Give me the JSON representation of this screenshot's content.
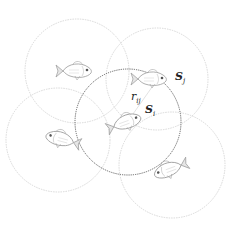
{
  "diagram": {
    "colors": {
      "faint_circle": "#d4d4d4",
      "focal_circle": "#555555",
      "fish_stroke": "#9a9a9a",
      "label": "#222222"
    },
    "circles": [
      {
        "id": "top-left",
        "cx": 77,
        "cy": 71,
        "r": 52,
        "style": "faint"
      },
      {
        "id": "top-right",
        "cx": 157,
        "cy": 79,
        "r": 51,
        "style": "faint"
      },
      {
        "id": "left",
        "cx": 58,
        "cy": 140,
        "r": 52,
        "style": "faint"
      },
      {
        "id": "bottom-right",
        "cx": 172,
        "cy": 165,
        "r": 53,
        "style": "faint"
      },
      {
        "id": "focal",
        "cx": 128,
        "cy": 122,
        "r": 53,
        "style": "focal"
      }
    ],
    "fish": [
      {
        "id": "fish-top-left",
        "x": 74,
        "y": 70,
        "facing": "right"
      },
      {
        "id": "fish-sj",
        "x": 152,
        "y": 79,
        "facing": "right"
      },
      {
        "id": "fish-si",
        "x": 128,
        "y": 121,
        "facing": "right"
      },
      {
        "id": "fish-left",
        "x": 62,
        "y": 139,
        "facing": "left"
      },
      {
        "id": "fish-bottom-right",
        "x": 168,
        "y": 168,
        "facing": "left"
      }
    ],
    "labels": {
      "sj": {
        "base": "S",
        "sub": "j"
      },
      "rij": {
        "base": "r",
        "sub": "ij"
      },
      "si": {
        "base": "S",
        "sub": "i"
      }
    }
  }
}
